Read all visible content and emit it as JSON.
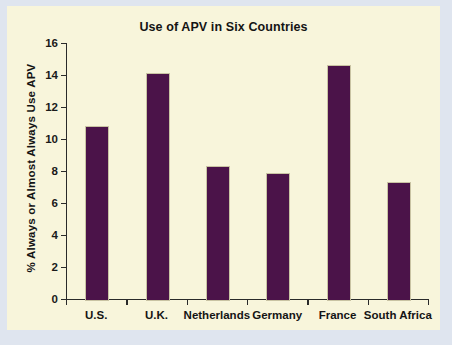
{
  "chart_data": {
    "type": "bar",
    "title": "Use of APV in Six Countries",
    "xlabel": "",
    "ylabel": "% Always or Almost Always Use APV",
    "categories": [
      "U.S.",
      "U.K.",
      "Netherlands",
      "Germany",
      "France",
      "South Africa"
    ],
    "values": [
      10.8,
      14.1,
      8.3,
      7.9,
      14.6,
      7.3
    ],
    "ylim": [
      0,
      16
    ],
    "ytick_labels": [
      "0",
      "2",
      "4",
      "6",
      "8",
      "10",
      "12",
      "14",
      "16"
    ],
    "ytick_values": [
      0,
      2,
      4,
      6,
      8,
      10,
      12,
      14,
      16
    ],
    "grid": false,
    "legend": false,
    "bar_color": "#4b1349",
    "panel_color": "#f8f5db",
    "figure_color": "#dfe5ef",
    "axis_color": "#2a2a2a"
  }
}
